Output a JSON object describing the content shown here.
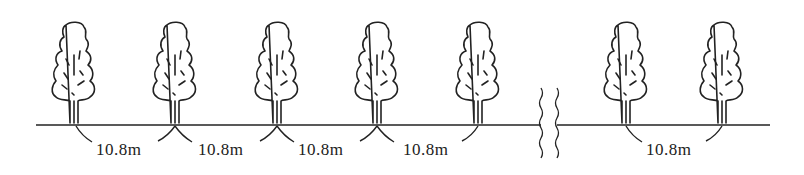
{
  "diagram": {
    "spacing_labels": [
      "10.8m",
      "10.8m",
      "10.8m",
      "10.8m",
      "10.8m"
    ],
    "tree_count": 7,
    "stroke_color": "#222222",
    "background_color": "#ffffff"
  }
}
